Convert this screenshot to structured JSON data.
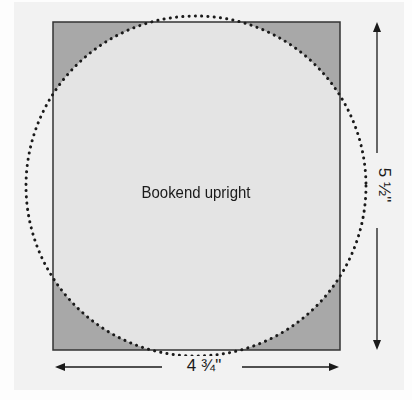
{
  "diagram": {
    "title": "Bookend upright",
    "dimensions": {
      "width_label": "4 ¾\"",
      "height_label": "5 ½\""
    },
    "colors": {
      "background": "#f2f2f2",
      "rect_fill": "#e4e4e4",
      "corner_fill": "#a8a8a8",
      "stroke": "#333333",
      "dots": "#1a1a1a"
    }
  }
}
